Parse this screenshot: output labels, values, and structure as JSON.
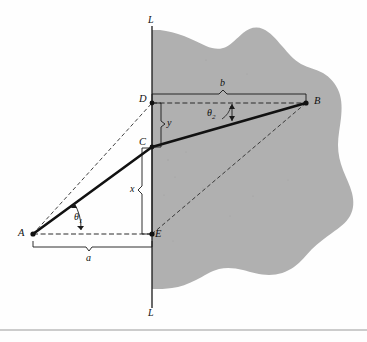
{
  "figure": {
    "type": "geometry-diagram",
    "colors": {
      "background": "#fefefe",
      "shaded_region": "#b0b0b0",
      "stroke": "#1a1a1a",
      "dashed": "#2b2b2b",
      "rule": "#999999"
    },
    "boundary_line": {
      "name": "L",
      "top_label": "L",
      "bottom_label": "L"
    },
    "points": [
      {
        "id": "A",
        "label": "A",
        "x": 33,
        "y": 234,
        "label_x": 18,
        "label_y": 229
      },
      {
        "id": "B",
        "label": "B",
        "x": 306,
        "y": 103,
        "label_x": 314,
        "label_y": 97
      },
      {
        "id": "C",
        "label": "C",
        "x": 152,
        "y": 147,
        "label_x": 140,
        "label_y": 138
      },
      {
        "id": "D",
        "label": "D",
        "x": 152,
        "y": 103,
        "label_x": 140,
        "label_y": 95
      },
      {
        "id": "E",
        "label": "E",
        "x": 152,
        "y": 234,
        "label_x": 156,
        "label_y": 231
      }
    ],
    "dimensions": [
      {
        "id": "a",
        "label": "a",
        "label_x": 89,
        "label_y": 256,
        "spans": "A to E",
        "orientation": "horizontal"
      },
      {
        "id": "b",
        "label": "b",
        "label_x": 222,
        "label_y": 80,
        "spans": "D to B",
        "orientation": "horizontal"
      },
      {
        "id": "x",
        "label": "x",
        "label_x": 133,
        "label_y": 188,
        "spans": "C to E",
        "orientation": "vertical"
      },
      {
        "id": "y",
        "label": "y",
        "label_x": 169,
        "label_y": 118,
        "spans": "D to C",
        "orientation": "vertical"
      }
    ],
    "angles": [
      {
        "id": "theta1",
        "label": "θ",
        "subscript": "1",
        "label_x": 76,
        "label_y": 215,
        "vertex": "A"
      },
      {
        "id": "theta2",
        "label": "θ",
        "subscript": "2",
        "label_x": 210,
        "label_y": 112,
        "vertex": "B"
      }
    ],
    "paths": {
      "solid_ray": "A to C to B",
      "dashed_lines": [
        "A to D",
        "A to E",
        "D to B",
        "E to B"
      ]
    }
  }
}
